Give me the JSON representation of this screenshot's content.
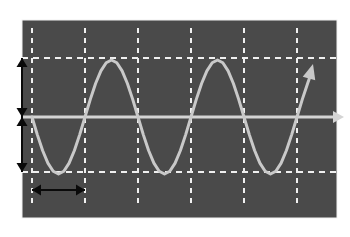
{
  "figure": {
    "canvas_width": 350,
    "canvas_height": 237,
    "page_background": "#ffffff",
    "plot_background": "#4a4a4a",
    "plot_rect": {
      "x": 22,
      "y": 20,
      "width": 315,
      "height": 198
    },
    "border_color": "#f2f2f2"
  },
  "colors": {
    "curve": "#c9c9c9",
    "axis": "#d4d4d4",
    "grid_dashed": "#f0f0f0",
    "annotation_arrow": "#0a0a0a",
    "plot_fill": "#4a4a4a",
    "page": "#ffffff"
  },
  "axes": {
    "x_axis": {
      "name": "horizontal-axis",
      "y_pixel": 117,
      "x_start": 22,
      "x_end": 337,
      "arrowhead": "right",
      "arrow_tip_x": 344,
      "label": ""
    },
    "y_zero_level": 117,
    "grid": {
      "enabled": true,
      "style": "dashed",
      "vertical_lines_x": [
        32,
        85,
        138,
        191,
        244,
        297
      ],
      "horizontal_lines_y": [
        58,
        172
      ],
      "vertical_line_top": 28,
      "vertical_line_bottom": 205,
      "horizontal_line_left": 22,
      "horizontal_line_right": 337
    }
  },
  "chart_data": {
    "type": "line",
    "subtitle": "",
    "xlabel": "",
    "ylabel": "",
    "grid": true,
    "legend_position": "none",
    "waveform": {
      "function": "-sin",
      "amplitude_pixels": 57,
      "period_pixels": 106,
      "phase_degrees": 180,
      "start_x_pixel": 32,
      "end_x_pixel": 311,
      "cycles_shown": 2.63,
      "peak_y_pixel": 58,
      "trough_y_pixel": 172,
      "zero_y_pixel": 117,
      "terminal_arrowhead": true,
      "terminal_arrow_tip": {
        "x": 313,
        "y": 64
      }
    },
    "x": [
      32,
      37.3,
      42.6,
      47.9,
      53.2,
      58.5,
      63.8,
      69.1,
      74.4,
      79.7,
      85,
      90.3,
      95.6,
      100.9,
      106.2,
      111.5,
      116.8,
      122.1,
      127.4,
      132.7,
      138,
      143.3,
      148.6,
      153.9,
      159.2,
      164.5,
      169.8,
      175.1,
      180.4,
      185.7,
      191,
      196.3,
      201.6,
      206.9,
      212.2,
      217.5,
      222.8,
      228.1,
      233.4,
      238.7,
      244,
      249.3,
      254.6,
      259.9,
      265.2,
      270.5,
      275.8,
      281.1,
      286.4,
      291.7,
      297,
      302.3,
      307.6,
      311
    ],
    "values": [
      0,
      -0.309,
      -0.588,
      -0.809,
      -0.951,
      -1.0,
      -0.951,
      -0.809,
      -0.588,
      -0.309,
      0,
      0.309,
      0.588,
      0.809,
      0.951,
      1.0,
      0.951,
      0.809,
      0.588,
      0.309,
      0,
      -0.309,
      -0.588,
      -0.809,
      -0.951,
      -1.0,
      -0.951,
      -0.809,
      -0.588,
      -0.309,
      0,
      0.309,
      0.588,
      0.809,
      0.951,
      1.0,
      0.951,
      0.809,
      0.588,
      0.309,
      0,
      -0.309,
      -0.588,
      -0.809,
      -0.951,
      -1.0,
      -0.951,
      -0.809,
      -0.588,
      -0.309,
      0,
      0.309,
      0.588,
      0.76
    ],
    "ylim": [
      -1,
      1
    ],
    "xlim": [
      32,
      337
    ]
  },
  "annotations": {
    "amplitude_upper": {
      "name": "amplitude-arrow-upper",
      "orientation": "vertical",
      "double_headed": true,
      "x_pixel": 22,
      "y_from": 58,
      "y_to": 117,
      "label": ""
    },
    "amplitude_lower": {
      "name": "amplitude-arrow-lower",
      "orientation": "vertical",
      "double_headed": true,
      "x_pixel": 22,
      "y_from": 117,
      "y_to": 172,
      "label": ""
    },
    "period_marker": {
      "name": "period-arrow",
      "orientation": "horizontal",
      "double_headed": true,
      "y_pixel": 190,
      "x_from": 32,
      "x_to": 85,
      "label": ""
    }
  }
}
